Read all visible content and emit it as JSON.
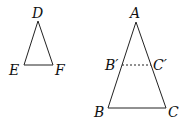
{
  "diagram": {
    "type": "geometry-similar-triangles",
    "stroke_color": "#222222",
    "background": "#ffffff",
    "triangles": [
      {
        "name": "DEF",
        "vertices": {
          "D": {
            "label": "D",
            "x": 38,
            "y": 21
          },
          "E": {
            "label": "E",
            "x": 24,
            "y": 65
          },
          "F": {
            "label": "F",
            "x": 53,
            "y": 65
          }
        }
      },
      {
        "name": "ABC",
        "vertices": {
          "A": {
            "label": "A",
            "x": 136,
            "y": 22
          },
          "B": {
            "label": "B",
            "x": 108,
            "y": 108
          },
          "C": {
            "label": "C",
            "x": 166,
            "y": 108
          }
        },
        "midline": {
          "style": "dashed",
          "from": {
            "label": "B′",
            "x": 122,
            "y": 65
          },
          "to": {
            "label": "C′",
            "x": 151,
            "y": 65
          }
        }
      }
    ]
  }
}
